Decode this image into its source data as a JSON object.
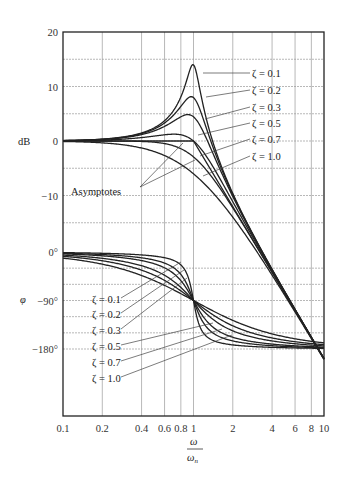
{
  "chart_data": {
    "type": "line",
    "xlabel_numerator": "ω",
    "xlabel_denominator": "ωn",
    "xscale": "log",
    "xlim": [
      0.1,
      10
    ],
    "x_ticks": [
      "0.1",
      "0.2",
      "0.4",
      "0.6",
      "0.8",
      "1",
      "2",
      "4",
      "6",
      "8",
      "10"
    ],
    "grid": true,
    "magnitude": {
      "ylabel": "dB",
      "ylim": [
        -20,
        20
      ],
      "y_ticks": [
        "20",
        "10",
        "0",
        "−10"
      ],
      "annotation": "Asymptotes",
      "series": [
        {
          "name": "ζ = 0.1",
          "zeta": 0.1,
          "peak_db": 14.0
        },
        {
          "name": "ζ = 0.2",
          "zeta": 0.2,
          "peak_db": 8.1
        },
        {
          "name": "ζ = 0.3",
          "zeta": 0.3,
          "peak_db": 4.8
        },
        {
          "name": "ζ = 0.5",
          "zeta": 0.5,
          "peak_db": 1.2
        },
        {
          "name": "ζ = 0.7",
          "zeta": 0.7,
          "peak_db": 0.0
        },
        {
          "name": "ζ = 1.0",
          "zeta": 1.0,
          "peak_db": 0.0
        }
      ],
      "asymptote": {
        "low": "0 dB for ω/ωn < 1",
        "high": "−40 dB/decade for ω/ωn > 1"
      }
    },
    "phase": {
      "ylabel": "φ",
      "ylim": [
        -270,
        0
      ],
      "y_ticks": [
        "0°",
        "−90°",
        "−180°"
      ],
      "series": [
        {
          "name": "ζ = 0.1",
          "zeta": 0.1
        },
        {
          "name": "ζ = 0.2",
          "zeta": 0.2
        },
        {
          "name": "ζ = 0.3",
          "zeta": 0.3
        },
        {
          "name": "ζ = 0.5",
          "zeta": 0.5
        },
        {
          "name": "ζ = 0.7",
          "zeta": 0.7
        },
        {
          "name": "ζ = 1.0",
          "zeta": 1.0
        }
      ]
    }
  },
  "labels": {
    "db_axis": "dB",
    "phi_axis": "φ",
    "asymptotes": "Asymptotes",
    "x_num": "ω",
    "x_den": "ω",
    "x_den_sub": "n"
  }
}
